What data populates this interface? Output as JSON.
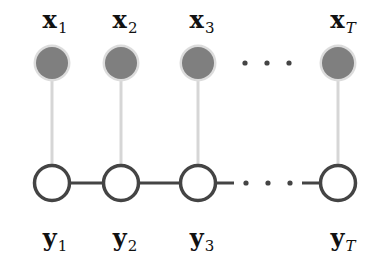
{
  "diagram": {
    "type": "graphical-model chain (CRF-like)",
    "observed_nodes": [
      {
        "label": "x",
        "subscript": "1",
        "cx": 52
      },
      {
        "label": "x",
        "subscript": "2",
        "cx": 121
      },
      {
        "label": "x",
        "subscript": "3",
        "cx": 198
      },
      {
        "label": "x",
        "subscript": "T",
        "cx": 338
      }
    ],
    "hidden_nodes": [
      {
        "label": "y",
        "subscript": "1",
        "cx": 52
      },
      {
        "label": "y",
        "subscript": "2",
        "cx": 121
      },
      {
        "label": "y",
        "subscript": "3",
        "cx": 198
      },
      {
        "label": "y",
        "subscript": "T",
        "cx": 338
      }
    ],
    "ellipsis": "· · ·",
    "colors": {
      "observed_fill": "#7f7f7f",
      "observed_halo": "#dcdcdc",
      "hidden_stroke": "#444444",
      "vertical_edge": "#d6d6d6",
      "chain_edge": "#444444"
    }
  }
}
